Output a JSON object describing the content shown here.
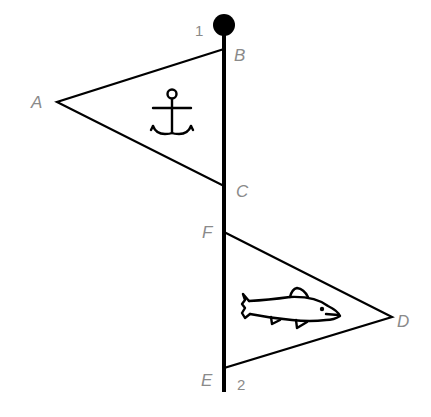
{
  "diagram": {
    "title": "",
    "pole": {
      "top_label": "1",
      "bottom_label": "2"
    },
    "points": {
      "A": "A",
      "B": "B",
      "C": "C",
      "D": "D",
      "E": "E",
      "F": "F"
    },
    "flags": [
      {
        "name": "top-flag",
        "vertices": [
          "A",
          "B",
          "C"
        ],
        "symbol": "anchor-icon"
      },
      {
        "name": "bottom-flag",
        "vertices": [
          "D",
          "E",
          "F"
        ],
        "symbol": "fish-icon"
      }
    ],
    "colors": {
      "stroke": "#000000",
      "label": "#8a8a8a",
      "background": "#ffffff"
    }
  }
}
